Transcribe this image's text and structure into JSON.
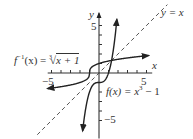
{
  "chart_data": {
    "type": "line",
    "title": "",
    "xlabel": "x",
    "ylabel": "y",
    "xlim": [
      -5.5,
      5.5
    ],
    "ylim": [
      -7,
      6.5
    ],
    "x_ticks": [
      -5,
      -4,
      -3,
      -2,
      -1,
      1,
      2,
      3,
      4,
      5
    ],
    "y_ticks": [
      -5,
      -4,
      -3,
      -2,
      -1,
      1,
      2,
      3,
      4,
      5
    ],
    "x_tick_labels": [
      "-5",
      "5"
    ],
    "y_tick_labels": [
      "5",
      "-5"
    ],
    "grid": false,
    "series": [
      {
        "name": "f(x) = x^3 - 1",
        "style": "solid",
        "formula": "x^3 - 1",
        "x": [
          -1.75,
          -1.5,
          -1,
          -0.5,
          0,
          0.5,
          1,
          1.5,
          1.9
        ],
        "y": [
          -6.36,
          -4.38,
          -2,
          -1.13,
          -1,
          -0.88,
          0,
          2.38,
          5.86
        ]
      },
      {
        "name": "f^-1(x) = cbrt(x + 1)",
        "style": "solid",
        "formula": "cbrt(x + 1)",
        "x": [
          -5.3,
          -4,
          -2,
          -1.5,
          -1,
          -0.5,
          0,
          1,
          2,
          4,
          5
        ],
        "y": [
          -1.75,
          -1.44,
          -1,
          -0.79,
          0,
          0.79,
          1,
          1.26,
          1.44,
          1.71,
          1.82
        ]
      },
      {
        "name": "y = x",
        "style": "dashed",
        "formula": "x",
        "x": [
          -6,
          6
        ],
        "y": [
          -6,
          6
        ]
      }
    ],
    "annotations": [
      "y = x",
      "f^-1(x) = ∛(x + 1)",
      "f(x) = x^3 - 1"
    ]
  },
  "labels": {
    "y_axis": "y",
    "x_axis": "x",
    "yx": "y = x",
    "finv_left": "f",
    "finv_sup": "−1",
    "finv_mid": "(x) = ",
    "finv_root_index": "3",
    "finv_radicand": "x + 1",
    "f_left": "f(x) = x",
    "f_sup": "3",
    "f_right": " − 1",
    "tick_y5": "5",
    "tick_yneg5": "−5",
    "tick_x5": "5",
    "tick_xneg5": "−5"
  }
}
